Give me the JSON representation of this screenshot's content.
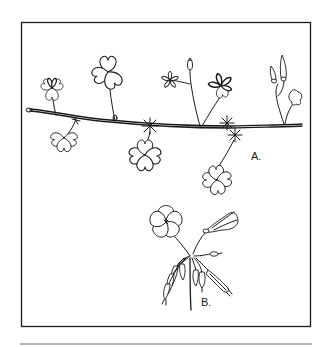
{
  "figure": {
    "labels": {
      "a": "A.",
      "b": "B."
    },
    "colors": {
      "ink": "#1a1a1a",
      "background": "#ffffff",
      "rule": "#b8b8b8"
    }
  }
}
